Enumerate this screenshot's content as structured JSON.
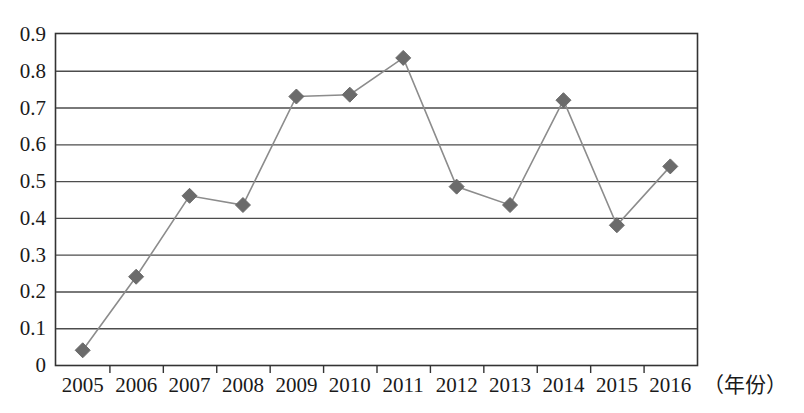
{
  "chart_data": {
    "type": "line",
    "title": "",
    "subtitle": "",
    "xlabel": "（年份）",
    "ylabel": "",
    "categories": [
      "2005",
      "2006",
      "2007",
      "2008",
      "2009",
      "2010",
      "2011",
      "2012",
      "2013",
      "2014",
      "2015",
      "2016"
    ],
    "values": [
      0.04,
      0.24,
      0.46,
      0.435,
      0.73,
      0.735,
      0.835,
      0.485,
      0.435,
      0.72,
      0.38,
      0.54
    ],
    "series": [
      {
        "name": "",
        "values": [
          0.04,
          0.24,
          0.46,
          0.435,
          0.73,
          0.735,
          0.835,
          0.485,
          0.435,
          0.72,
          0.38,
          0.54
        ]
      }
    ],
    "ylim": [
      0,
      0.9
    ],
    "ytick_labels": [
      "0",
      "0.1",
      "0.2",
      "0.3",
      "0.4",
      "0.5",
      "0.6",
      "0.7",
      "0.8",
      "0.9"
    ],
    "ytick_values": [
      0,
      0.1,
      0.2,
      0.3,
      0.4,
      0.5,
      0.6,
      0.7,
      0.8,
      0.9
    ],
    "grid": "horizontal",
    "legend": "none",
    "marker": "diamond",
    "marker_color": "#6b6b6b",
    "line_color": "#8c8c8c",
    "axis_color": "#333333",
    "grid_color": "#4d4d4d",
    "annotations": []
  },
  "axis": {
    "x_caption": "（年份）"
  }
}
